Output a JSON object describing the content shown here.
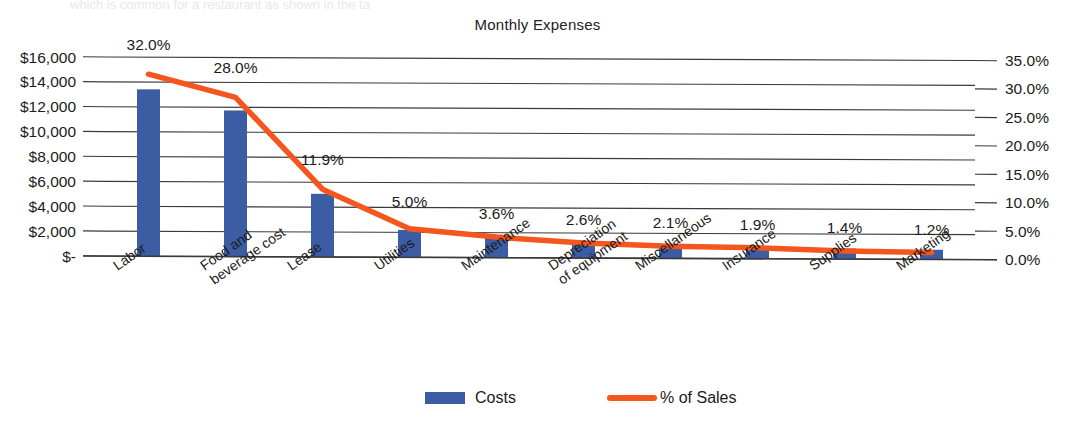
{
  "chart_data": {
    "type": "bar",
    "title": "Monthly Expenses",
    "xlabel": "",
    "ylabel": "",
    "grid": true,
    "legend_position": "bottom",
    "categories": [
      "Labor",
      "Food and beverage cost",
      "Lease",
      "Utilities",
      "Maintenance",
      "Depreciation of equipment",
      "Miscellaneous",
      "Insurance",
      "Supplies",
      "Marketing"
    ],
    "category_lines": [
      [
        "Labor"
      ],
      [
        "Food and",
        "beverage cost"
      ],
      [
        "Lease"
      ],
      [
        "Utilities"
      ],
      [
        "Maintenance"
      ],
      [
        "Depreciation",
        "of equipment"
      ],
      [
        "Miscellaneous"
      ],
      [
        "Insurance"
      ],
      [
        "Supplies"
      ],
      [
        "Marketing"
      ]
    ],
    "series": [
      {
        "name": "Costs",
        "type": "bar",
        "axis": "left",
        "color": "#3c5ca4",
        "values": [
          13400,
          11700,
          5000,
          2100,
          1500,
          1100,
          900,
          800,
          600,
          500
        ]
      },
      {
        "name": "% of Sales",
        "type": "line",
        "axis": "right",
        "color": "#f4561e",
        "values": [
          32.0,
          28.0,
          11.9,
          5.0,
          3.6,
          2.6,
          2.1,
          1.9,
          1.4,
          1.2
        ],
        "data_labels": [
          "32.0%",
          "28.0%",
          "11.9%",
          "5.0%",
          "3.6%",
          "2.6%",
          "2.1%",
          "1.9%",
          "1.4%",
          "1.2%"
        ]
      }
    ],
    "left_axis": {
      "ticks": [
        0,
        2000,
        4000,
        6000,
        8000,
        10000,
        12000,
        14000,
        16000
      ],
      "tick_labels": [
        "$-",
        "$2,000",
        "$4,000",
        "$6,000",
        "$8,000",
        "$10,000",
        "$12,000",
        "$14,000",
        "$16,000"
      ],
      "ylim": [
        0,
        16000
      ]
    },
    "right_axis": {
      "ticks": [
        0,
        5,
        10,
        15,
        20,
        25,
        30,
        35
      ],
      "tick_labels": [
        "0.0%",
        "5.0%",
        "10.0%",
        "15.0%",
        "20.0%",
        "25.0%",
        "30.0%",
        "35.0%"
      ],
      "ylim": [
        0,
        35
      ]
    },
    "legend": [
      {
        "label": "Costs",
        "marker": "bar",
        "color": "#3c5ca4"
      },
      {
        "label": "% of Sales",
        "marker": "line",
        "color": "#f4561e"
      }
    ]
  },
  "page": {
    "clipped_header_text": "which is common for a restaurant as shown in the table"
  }
}
